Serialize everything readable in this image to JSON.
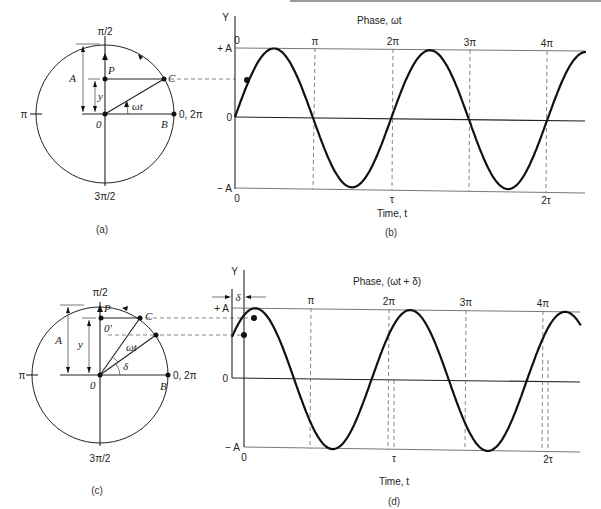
{
  "colors": {
    "ink": "#111111",
    "guide": "#666666",
    "background": "#ffffff"
  },
  "panel_a": {
    "caption": "(a)",
    "top_label": "π/2",
    "bottom_label": "3π/2",
    "left_label": "π",
    "right_label": "0, 2π",
    "point_P": "P",
    "point_C": "C",
    "point_B": "B",
    "origin": "0",
    "amp_label": "A",
    "y_label": "y",
    "angle_label": "ωt"
  },
  "panel_b": {
    "caption": "(b)",
    "y_axis": "Y",
    "phase_title": "Phase, ωt",
    "phase_ticks": [
      "0",
      "π",
      "2π",
      "3π",
      "4π"
    ],
    "plus_a": "+ A",
    "minus_a": "− A",
    "zero": "0",
    "time_zero": "0",
    "time_ticks": [
      "τ",
      "2τ"
    ],
    "time_label": "Time, t"
  },
  "panel_c": {
    "caption": "(c)",
    "top_label": "π/2",
    "bottom_label": "3π/2",
    "left_label": "π",
    "right_label": "0, 2π",
    "point_P": "P",
    "point_C": "C",
    "point_B": "B",
    "origin": "0",
    "origin_prime": "0′",
    "amp_label": "A",
    "y_label": "y",
    "angle_label": "ωt",
    "delta_label": "δ"
  },
  "panel_d": {
    "caption": "(d)",
    "y_axis": "Y",
    "delta_label": "δ",
    "phase_title": "Phase, (ωt + δ)",
    "phase_ticks": [
      "π",
      "2π",
      "3π",
      "4π"
    ],
    "plus_a": "+ A",
    "minus_a": "− A",
    "zero": "0",
    "time_zero": "0",
    "time_ticks": [
      "τ",
      "2τ"
    ],
    "time_label": "Time, t"
  },
  "chart_data": [
    {
      "type": "line",
      "title": "Phase, ωt",
      "xlabel": "Time, t",
      "ylabel": "Y",
      "function": "y = A sin(ωt)",
      "phase_ticks": [
        "0",
        "π",
        "2π",
        "3π",
        "4π"
      ],
      "time_ticks": [
        "0",
        "τ",
        "2τ"
      ],
      "y_ticks": [
        "−A",
        "0",
        "+A"
      ],
      "phase_range": [
        0,
        4.5
      ],
      "phase_unit": "π",
      "phase_offset": 0,
      "ylim": [
        -1,
        1
      ],
      "marked_point_phase": 0.2
    },
    {
      "type": "line",
      "title": "Phase, (ωt + δ)",
      "xlabel": "Time, t",
      "ylabel": "Y",
      "function": "y = A sin(ωt + δ)",
      "phase_ticks": [
        "π",
        "2π",
        "3π",
        "4π"
      ],
      "time_ticks": [
        "0",
        "τ",
        "2τ"
      ],
      "y_ticks": [
        "−A",
        "0",
        "+A"
      ],
      "phase_range": [
        0,
        4.5
      ],
      "phase_unit": "π",
      "phase_offset": 0.2,
      "ylim": [
        -1,
        1
      ],
      "marked_point_phases": [
        0.2,
        0.3
      ]
    }
  ]
}
